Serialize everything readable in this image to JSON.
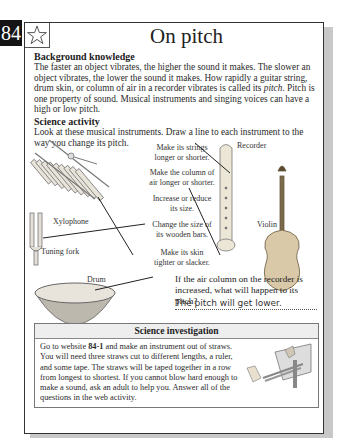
{
  "page": {
    "number": "84",
    "title": "On pitch"
  },
  "background": {
    "heading": "Background knowledge",
    "text_1": "The faster an object vibrates, the higher the sound it makes. The slower an object vibrates, the lower the sound it makes. How rapidly a guitar string, drum skin, or column of air in a recorder vibrates is called its ",
    "text_em": "pitch",
    "text_2": ". Pitch is one property of sound. Musical instruments and singing voices can have a high or low pitch."
  },
  "activity": {
    "heading": "Science activity",
    "instructions": "Look at these musical instruments. Draw a line to each instrument to the way you change its pitch.",
    "instruments": [
      {
        "name": "Xylophone"
      },
      {
        "name": "Tuning fork"
      },
      {
        "name": "Drum"
      },
      {
        "name": "Recorder"
      },
      {
        "name": "Violin"
      }
    ],
    "methods": [
      {
        "line1": "Make its strings",
        "line2": "longer or shorter."
      },
      {
        "line1": "Make the column of",
        "line2": "air longer or shorter."
      },
      {
        "line1": "Increase or reduce",
        "line2": "its size."
      },
      {
        "line1": "Change the size of",
        "line2": "its wooden bars."
      },
      {
        "line1": "Make its skin",
        "line2": "tighter or slacker."
      }
    ],
    "question": "If the air column on the recorder is increased, what will happen to its pitch?",
    "answer": "The pitch will get lower."
  },
  "investigation": {
    "heading": "Science investigation",
    "text_1": "Go to website ",
    "code": "84-1",
    "text_2": " and make an instrument out of straws. You will need three straws cut to different lengths, a ruler, and some tape. The straws will be taped together in a row from longest to shortest. If you cannot blow hard enough to make a sound, ask an adult to help you. Answer all of the questions in the web activity."
  },
  "icons": {
    "star": "star-outline-icon"
  }
}
